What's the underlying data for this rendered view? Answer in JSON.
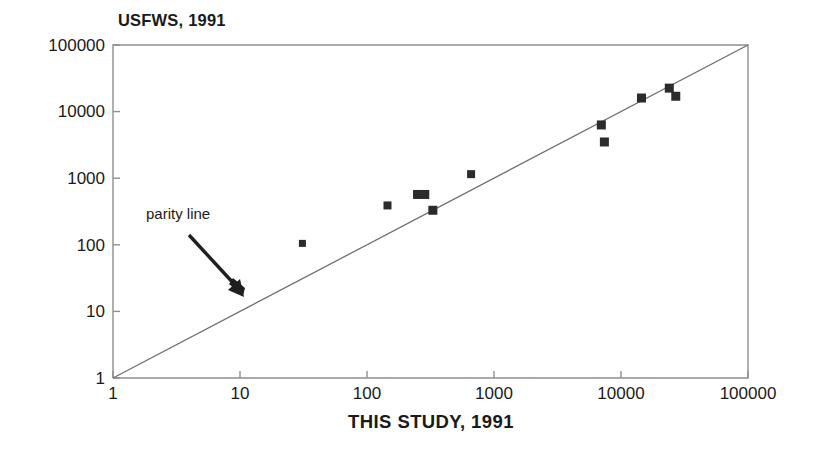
{
  "chart_data": {
    "type": "scatter",
    "title": "USFWS, 1991",
    "xlabel": "THIS STUDY, 1991",
    "ylabel": "USFWS, 1991",
    "xscale": "log",
    "yscale": "log",
    "xlim": [
      1,
      100000
    ],
    "ylim": [
      1,
      100000
    ],
    "grid": false,
    "legend": "none",
    "xticks": [
      "1",
      "10",
      "100",
      "1000",
      "10000",
      "100000"
    ],
    "yticks": [
      "1",
      "10",
      "100",
      "1000",
      "10000",
      "100000"
    ],
    "xtick_values": [
      1,
      10,
      100,
      1000,
      10000,
      100000
    ],
    "ytick_values": [
      1,
      10,
      100,
      1000,
      10000,
      100000
    ],
    "marker": "filled-square",
    "marker_color": "#2b2b2b",
    "points": [
      {
        "x": 31,
        "y": 105
      },
      {
        "x": 145,
        "y": 390
      },
      {
        "x": 250,
        "y": 570
      },
      {
        "x": 285,
        "y": 570
      },
      {
        "x": 330,
        "y": 330
      },
      {
        "x": 660,
        "y": 1150
      },
      {
        "x": 7000,
        "y": 6300
      },
      {
        "x": 7400,
        "y": 3500
      },
      {
        "x": 14500,
        "y": 16000
      },
      {
        "x": 24000,
        "y": 22500
      },
      {
        "x": 27000,
        "y": 17000
      }
    ],
    "reference_line": {
      "label": "parity line",
      "from": [
        1,
        1
      ],
      "to": [
        100000,
        100000
      ],
      "color": "#6b6b6b"
    },
    "annotations": [
      {
        "text": "parity line",
        "arrow_from": [
          20,
          30
        ],
        "arrow_to": [
          80,
          7
        ]
      }
    ]
  },
  "axis": {
    "frame_color": "#8a8a8a",
    "tick_color": "#8a8a8a"
  }
}
